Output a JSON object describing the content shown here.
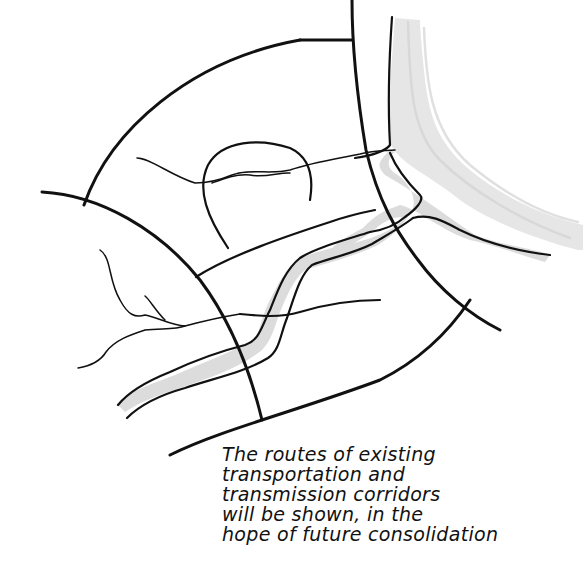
{
  "diagram": {
    "type": "hand-drawn planning map sketch",
    "elements": [
      "outer arc boundary",
      "radial boundary roads",
      "circular domed district",
      "branching river with gray fill",
      "coastline with gray shading",
      "transmission corridor double line",
      "small tributary streams"
    ],
    "colors": {
      "ink": "#111111",
      "river_fill": "#d9d9d9",
      "coast_shade": "#e3e3e3",
      "background": "#ffffff"
    }
  },
  "caption": {
    "lines": [
      "The routes of existing",
      "transportation and",
      "transmission corridors",
      "will be shown, in the",
      "hope of future consolidation"
    ]
  }
}
